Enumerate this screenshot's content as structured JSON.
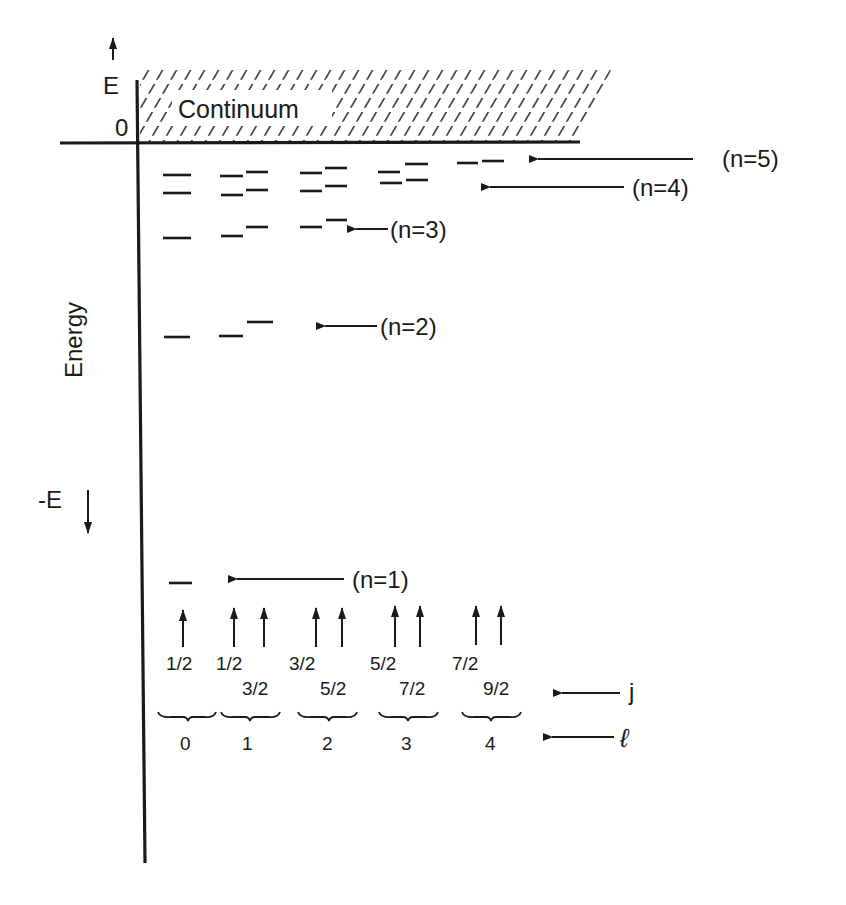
{
  "diagram": {
    "axis": {
      "top_label": "E",
      "zero_label": "0",
      "energy_label": "Energy",
      "bottom_label": "-E"
    },
    "continuum_label": "Continuum",
    "n_labels": {
      "n1": "(n=1)",
      "n2": "(n=2)",
      "n3": "(n=3)",
      "n4": "(n=4)",
      "n5": "(n=5)"
    },
    "j_values": {
      "l0_j1": "1/2",
      "l1_j1": "1/2",
      "l1_j2": "3/2",
      "l2_j1": "3/2",
      "l2_j2": "5/2",
      "l3_j1": "5/2",
      "l3_j2": "7/2",
      "l4_j1": "7/2",
      "l4_j2": "9/2"
    },
    "l_values": {
      "l0": "0",
      "l1": "1",
      "l2": "2",
      "l3": "3",
      "l4": "4"
    },
    "j_row_label": "j",
    "l_row_label": "ℓ",
    "levels": [
      {
        "n": 1,
        "l": 0,
        "j": "1/2"
      },
      {
        "n": 2,
        "l": 0,
        "j": "1/2"
      },
      {
        "n": 2,
        "l": 1,
        "j": "1/2"
      },
      {
        "n": 2,
        "l": 1,
        "j": "3/2"
      },
      {
        "n": 3,
        "l": 0,
        "j": "1/2"
      },
      {
        "n": 3,
        "l": 1,
        "j": "1/2"
      },
      {
        "n": 3,
        "l": 1,
        "j": "3/2"
      },
      {
        "n": 3,
        "l": 2,
        "j": "3/2"
      },
      {
        "n": 3,
        "l": 2,
        "j": "5/2"
      },
      {
        "n": 4,
        "l": 0,
        "j": "1/2"
      },
      {
        "n": 4,
        "l": 1,
        "j": "1/2"
      },
      {
        "n": 4,
        "l": 1,
        "j": "3/2"
      },
      {
        "n": 4,
        "l": 2,
        "j": "3/2"
      },
      {
        "n": 4,
        "l": 2,
        "j": "5/2"
      },
      {
        "n": 4,
        "l": 3,
        "j": "5/2"
      },
      {
        "n": 4,
        "l": 3,
        "j": "7/2"
      },
      {
        "n": 5,
        "l": 0,
        "j": "1/2"
      },
      {
        "n": 5,
        "l": 1,
        "j": "1/2"
      },
      {
        "n": 5,
        "l": 1,
        "j": "3/2"
      },
      {
        "n": 5,
        "l": 2,
        "j": "3/2"
      },
      {
        "n": 5,
        "l": 2,
        "j": "5/2"
      },
      {
        "n": 5,
        "l": 3,
        "j": "5/2"
      },
      {
        "n": 5,
        "l": 3,
        "j": "7/2"
      },
      {
        "n": 5,
        "l": 4,
        "j": "7/2"
      },
      {
        "n": 5,
        "l": 4,
        "j": "9/2"
      }
    ],
    "ink_color": "#1a1a1a"
  }
}
